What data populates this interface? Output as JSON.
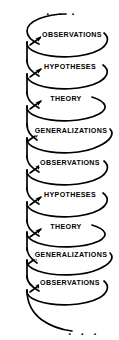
{
  "diagram": {
    "type": "spiral-cycle",
    "stroke_color": "#000000",
    "background_color": "#ffffff",
    "text_color": "#000000",
    "top_ellipsis": ". . .",
    "bottom_ellipsis": ". . .",
    "stages": [
      {
        "label": "OBSERVATIONS",
        "cx": 72,
        "cy": 36
      },
      {
        "label": "HYPOTHESES",
        "cx": 70,
        "cy": 68
      },
      {
        "label": "THEORY",
        "cx": 66,
        "cy": 100
      },
      {
        "label": "GENERALIZATIONS",
        "cx": 71,
        "cy": 132
      },
      {
        "label": "OBSERVATIONS",
        "cx": 70,
        "cy": 164
      },
      {
        "label": "HYPOTHESES",
        "cx": 70,
        "cy": 196
      },
      {
        "label": "THEORY",
        "cx": 66,
        "cy": 228
      },
      {
        "label": "GENERALIZATIONS",
        "cx": 71,
        "cy": 256
      },
      {
        "label": "OBSERVATIONS",
        "cx": 70,
        "cy": 284
      }
    ]
  }
}
